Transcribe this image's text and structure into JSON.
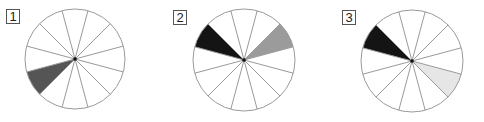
{
  "figure": {
    "segments_per_circle": 12,
    "line_offset_deg": 15,
    "stroke_color": "#9a9a9a",
    "panels": [
      {
        "label": "1",
        "center": [
          75,
          59
        ],
        "radius": 50,
        "label_pos": [
          6,
          9
        ],
        "shaded": [
          {
            "start_deg": 195,
            "end_deg": 225,
            "color": "#555555"
          }
        ]
      },
      {
        "label": "2",
        "center": [
          244,
          60
        ],
        "radius": 51,
        "label_pos": [
          173,
          10
        ],
        "shaded": [
          {
            "start_deg": 135,
            "end_deg": 165,
            "color": "#141414"
          },
          {
            "start_deg": 15,
            "end_deg": 45,
            "color": "#9b9b9b"
          }
        ]
      },
      {
        "label": "3",
        "center": [
          412,
          61
        ],
        "radius": 51,
        "label_pos": [
          342,
          10
        ],
        "shaded": [
          {
            "start_deg": 135,
            "end_deg": 165,
            "color": "#141414"
          },
          {
            "start_deg": 315,
            "end_deg": 345,
            "color": "#e6e6e6"
          }
        ]
      }
    ]
  }
}
